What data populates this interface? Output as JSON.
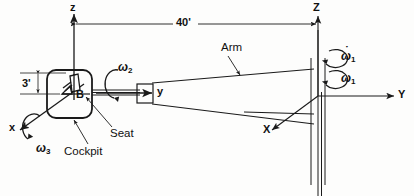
{
  "figure": {
    "type": "engineering-mechanics-diagram",
    "background_color": "#fdfdfc",
    "line_color": "#1a1a1a"
  },
  "axes": [
    {
      "id": "z-local",
      "label": "z",
      "case": "lower",
      "orientation": "vertical-up",
      "label_x": 70,
      "label_y": 2
    },
    {
      "id": "y-local",
      "label": "y",
      "case": "lower",
      "orientation": "horizontal-right",
      "label_x": 157,
      "label_y": 95
    },
    {
      "id": "x-local",
      "label": "x",
      "case": "lower",
      "orientation": "oblique-down-left",
      "label_x": 9,
      "label_y": 122
    },
    {
      "id": "Z-global",
      "label": "Z",
      "case": "upper",
      "orientation": "vertical-up",
      "label_x": 318,
      "label_y": 2
    },
    {
      "id": "Y-global",
      "label": "Y",
      "case": "upper",
      "orientation": "horizontal-right",
      "label_x": 398,
      "label_y": 90
    },
    {
      "id": "X-global",
      "label": "X",
      "case": "upper",
      "orientation": "oblique-down-left",
      "label_x": 263,
      "label_y": 124
    }
  ],
  "angular_velocities": [
    {
      "id": "omega1-dot",
      "symbol": "ω",
      "subscript": "1",
      "has_dot": true,
      "label_x": 341,
      "label_y": 52,
      "about": "Z-global",
      "note": "angular acceleration of column"
    },
    {
      "id": "omega1",
      "symbol": "ω",
      "subscript": "1",
      "has_dot": false,
      "label_x": 341,
      "label_y": 74,
      "about": "Z-global",
      "note": "column spin rate"
    },
    {
      "id": "omega2",
      "symbol": "ω",
      "subscript": "2",
      "has_dot": false,
      "label_x": 118,
      "label_y": 63,
      "about": "y-local",
      "note": "arm/cockpit roll about arm axis"
    },
    {
      "id": "omega3",
      "symbol": "ω",
      "subscript": "3",
      "has_dot": false,
      "label_x": 36,
      "label_y": 144,
      "about": "x-local",
      "note": "cockpit pitch about x axis"
    }
  ],
  "dimensions": [
    {
      "id": "arm-length",
      "value": "40'",
      "label_x": 179,
      "label_y": 13,
      "type": "horizontal-double-arrow",
      "from": "z-local axis",
      "to": "Z-global column"
    },
    {
      "id": "seat-height",
      "value": "3'",
      "label_x": 23,
      "label_y": 79,
      "type": "vertical-double-arrow",
      "note": "offset of point B below top extension line"
    }
  ],
  "point_labels": [
    {
      "id": "point-B",
      "label": "B",
      "label_x": 79,
      "label_y": 89,
      "note": "pilot location in cockpit"
    }
  ],
  "callouts": [
    {
      "id": "arm-callout",
      "label": "Arm",
      "label_x": 221,
      "label_y": 43,
      "leader_to": "upper arm edge"
    },
    {
      "id": "seat-callout",
      "label": "Seat",
      "label_x": 110,
      "label_y": 130,
      "leader_to": "seat inside cockpit"
    },
    {
      "id": "cockpit-callout",
      "label": "Cockpit",
      "label_x": 70,
      "label_y": 148,
      "leader_to": "rounded cockpit enclosure"
    }
  ]
}
